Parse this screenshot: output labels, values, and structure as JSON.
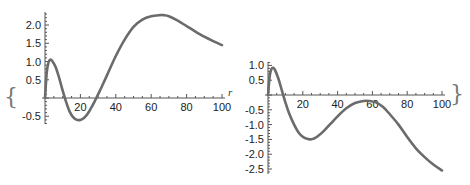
{
  "colors": {
    "curve": "#6b6b6b",
    "axis": "#555555",
    "text": "#222222"
  },
  "decorations": {
    "open_brace": "{",
    "close_brace": "}",
    "axis_variable": "r"
  },
  "chart_data": [
    {
      "type": "line",
      "title": "",
      "xlabel": "r",
      "ylabel": "",
      "xlim": [
        0,
        100
      ],
      "ylim": [
        -0.7,
        2.35
      ],
      "x_ticks": [
        20,
        40,
        60,
        80,
        100
      ],
      "y_ticks": [
        -0.5,
        0.5,
        1.0,
        1.5,
        2.0
      ],
      "x_tick_labels": [
        "20",
        "40",
        "60",
        "80",
        "100"
      ],
      "y_tick_labels": [
        "-0.5",
        "0.5",
        "1.0",
        "1.5",
        "2.0"
      ],
      "grid": false,
      "series": [
        {
          "name": "left curve",
          "x": [
            0,
            1,
            2,
            3,
            4,
            6,
            8,
            10,
            12,
            14,
            16,
            18,
            20,
            22,
            24,
            26,
            28,
            30,
            32,
            35,
            40,
            45,
            50,
            55,
            60,
            65,
            67,
            70,
            75,
            80,
            85,
            90,
            95,
            100
          ],
          "values": [
            0,
            0.7,
            0.98,
            1.05,
            1.02,
            0.85,
            0.55,
            0.2,
            -0.12,
            -0.38,
            -0.53,
            -0.6,
            -0.6,
            -0.55,
            -0.44,
            -0.28,
            -0.1,
            0.1,
            0.3,
            0.62,
            1.15,
            1.6,
            1.95,
            2.15,
            2.24,
            2.27,
            2.27,
            2.24,
            2.12,
            1.97,
            1.82,
            1.68,
            1.56,
            1.45
          ]
        }
      ]
    },
    {
      "type": "line",
      "title": "",
      "xlabel": "",
      "ylabel": "",
      "xlim": [
        0,
        100
      ],
      "ylim": [
        -2.6,
        1.05
      ],
      "x_ticks": [
        20,
        40,
        60,
        80,
        100
      ],
      "y_ticks": [
        -2.5,
        -2.0,
        -1.5,
        -1.0,
        -0.5,
        0.5,
        1.0
      ],
      "x_tick_labels": [
        "20",
        "40",
        "60",
        "80",
        "100"
      ],
      "y_tick_labels": [
        "-2.5",
        "-2.0",
        "-1.5",
        "-1.0",
        "-0.5",
        "0.5",
        "1.0"
      ],
      "grid": false,
      "series": [
        {
          "name": "right curve",
          "x": [
            0,
            1,
            2,
            3,
            4,
            6,
            8,
            10,
            12,
            15,
            18,
            21,
            24,
            26,
            28,
            32,
            36,
            40,
            45,
            50,
            55,
            58,
            62,
            66,
            70,
            75,
            80,
            85,
            90,
            95,
            100
          ],
          "values": [
            0,
            0.65,
            0.88,
            0.92,
            0.85,
            0.55,
            0.15,
            -0.25,
            -0.6,
            -1.0,
            -1.3,
            -1.45,
            -1.5,
            -1.48,
            -1.42,
            -1.22,
            -0.97,
            -0.72,
            -0.45,
            -0.27,
            -0.2,
            -0.2,
            -0.25,
            -0.4,
            -0.65,
            -1.0,
            -1.42,
            -1.8,
            -2.1,
            -2.35,
            -2.55
          ]
        }
      ]
    }
  ]
}
